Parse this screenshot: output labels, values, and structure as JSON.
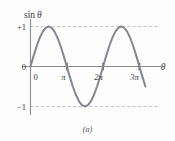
{
  "figure": {
    "caption": "(a)",
    "background_color": "#fdfdfd"
  },
  "axes": {
    "y_axis_label": "sin",
    "y_axis_label_variable": "θ",
    "x_axis_label": "θ",
    "axis_color": "#8a8a93",
    "origin_label": "0",
    "y_ticks": [
      {
        "label": "+1",
        "value": 1
      },
      {
        "label": "0",
        "value": 0
      },
      {
        "label": "−1",
        "value": -1
      }
    ],
    "x_ticks": [
      {
        "label": "0",
        "value": 0
      },
      {
        "label": "π",
        "value": 3.14159
      },
      {
        "label": "2π",
        "value": 6.28319
      },
      {
        "label": "3π",
        "value": 9.42478
      }
    ],
    "gridlines": {
      "style": "dashed",
      "color": "#a8a8b4",
      "values": [
        1,
        -1
      ]
    }
  },
  "chart_data": {
    "type": "line",
    "title": "",
    "subtitle": "",
    "xlabel": "θ",
    "ylabel": "sin θ",
    "xlim": [
      -0.35,
      10.4
    ],
    "ylim": [
      -1.45,
      1.45
    ],
    "grid": true,
    "legend": null,
    "annotations": [
      "(a)"
    ],
    "x_tick_labels": [
      "0",
      "π",
      "2π",
      "3π"
    ],
    "x_tick_values": [
      0,
      3.14159,
      6.28319,
      9.42478
    ],
    "y_tick_labels": [
      "+1",
      "0",
      "−1"
    ],
    "y_tick_values": [
      1,
      0,
      -1
    ],
    "series": [
      {
        "name": "sin θ",
        "color": "#8c8490",
        "line_width": 2,
        "x": [
          0,
          0.2618,
          0.5236,
          0.7854,
          1.0472,
          1.309,
          1.5708,
          1.8326,
          2.0944,
          2.3562,
          2.618,
          2.8798,
          3.1416,
          3.4034,
          3.6652,
          3.927,
          4.1888,
          4.4506,
          4.7124,
          4.9742,
          5.236,
          5.4978,
          5.7596,
          6.0214,
          6.2832,
          6.545,
          6.8068,
          7.0686,
          7.3304,
          7.5922,
          7.854,
          8.1158,
          8.3776,
          8.6394,
          8.9012,
          9.163,
          9.4248,
          9.6866,
          9.9484
        ],
        "y": [
          0,
          0.2588,
          0.5,
          0.7071,
          0.866,
          0.9659,
          1,
          0.9659,
          0.866,
          0.7071,
          0.5,
          0.2588,
          0,
          -0.2588,
          -0.5,
          -0.7071,
          -0.866,
          -0.9659,
          -1,
          -0.9659,
          -0.866,
          -0.7071,
          -0.5,
          -0.2588,
          0,
          0.2588,
          0.5,
          0.7071,
          0.866,
          0.9659,
          1,
          0.9659,
          0.866,
          0.7071,
          0.5,
          0.2588,
          0,
          -0.2588,
          -0.5
        ]
      }
    ]
  }
}
